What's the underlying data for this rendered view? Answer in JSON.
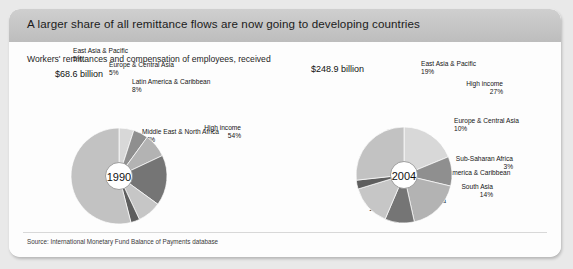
{
  "header": {
    "title": "A larger share of all remittance flows are now going to developing countries"
  },
  "panel": {
    "subtitle": "Workers' remittances and compensation of employees, received",
    "source": "Source: International Monetary Fund Balance of Payments database"
  },
  "charts": [
    {
      "id": "chart-1990",
      "year": "1990",
      "total": "$68.6 billion",
      "slices": [
        {
          "label": "East Asia & Pacific",
          "pct": "5%",
          "value": 5,
          "color": "#d8d8d8"
        },
        {
          "label": "Europe & Central Asia",
          "pct": "5%",
          "value": 5,
          "color": "#8f8f8f"
        },
        {
          "label": "Latin America & Caribbean",
          "pct": "8%",
          "value": 8,
          "color": "#b3b3b3"
        },
        {
          "label": "Middle East & North Africa",
          "pct": "17%",
          "value": 17,
          "color": "#757575"
        },
        {
          "label": "South Asia",
          "pct": "8%",
          "value": 8,
          "color": "#c6c6c6"
        },
        {
          "label": "Sub-Saharan Africa",
          "pct": "3%",
          "value": 3,
          "color": "#5e5e5e"
        },
        {
          "label": "High income",
          "pct": "54%",
          "value": 54,
          "color": "#c2c2c2"
        }
      ]
    },
    {
      "id": "chart-2004",
      "year": "2004",
      "total": "$248.9 billion",
      "slices": [
        {
          "label": "East Asia & Pacific",
          "pct": "19%",
          "value": 19,
          "color": "#d8d8d8"
        },
        {
          "label": "Europe & Central Asia",
          "pct": "10%",
          "value": 10,
          "color": "#8f8f8f"
        },
        {
          "label": "Latin America & Caribbean",
          "pct": "18%",
          "value": 18,
          "color": "#b3b3b3"
        },
        {
          "label": "Middle East & North Africa",
          "pct": "10%",
          "value": 10,
          "color": "#757575"
        },
        {
          "label": "South Asia",
          "pct": "14%",
          "value": 14,
          "color": "#c6c6c6"
        },
        {
          "label": "Sub-Saharan Africa",
          "pct": "3%",
          "value": 3,
          "color": "#5e5e5e"
        },
        {
          "label": "High income",
          "pct": "27%",
          "value": 27,
          "color": "#c2c2c2"
        }
      ]
    }
  ],
  "chart_data": {
    "type": "pie",
    "title": "A larger share of all remittance flows are now going to developing countries",
    "subtitle": "Workers' remittances and compensation of employees, received",
    "source": "Source: International Monetary Fund Balance of Payments database",
    "units": "percent of total",
    "categories": [
      "East Asia & Pacific",
      "Europe & Central Asia",
      "Latin America & Caribbean",
      "Middle East & North Africa",
      "South Asia",
      "Sub-Saharan Africa",
      "High income"
    ],
    "series": [
      {
        "name": "1990",
        "total": "$68.6 billion",
        "values": [
          5,
          5,
          8,
          17,
          8,
          3,
          54
        ]
      },
      {
        "name": "2004",
        "total": "$248.9 billion",
        "values": [
          19,
          10,
          18,
          10,
          14,
          3,
          27
        ]
      }
    ],
    "legend": "inline callout labels",
    "grid": false
  }
}
